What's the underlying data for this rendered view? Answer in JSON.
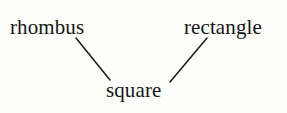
{
  "diagram": {
    "type": "concept-hierarchy-tree",
    "background_color": "#fdfdfc",
    "ink_color": "#161616",
    "edge_color": "#1f1f1f",
    "nodes": [
      {
        "id": "rhombus",
        "label": "rhombus",
        "role": "parent-left"
      },
      {
        "id": "rectangle",
        "label": "rectangle",
        "role": "parent-right"
      },
      {
        "id": "square",
        "label": "square",
        "role": "child"
      }
    ],
    "edges": [
      {
        "id": "rhombus-to-square",
        "from": "rhombus",
        "to": "square",
        "x1": 76,
        "y1": 38,
        "x2": 110,
        "y2": 80
      },
      {
        "id": "rectangle-to-square",
        "from": "rectangle",
        "to": "square",
        "x1": 207,
        "y1": 38,
        "x2": 170,
        "y2": 82
      }
    ]
  }
}
